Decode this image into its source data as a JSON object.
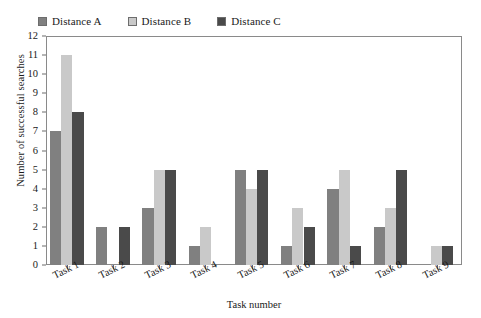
{
  "chart_data": {
    "type": "bar",
    "title": "",
    "xlabel": "Task number",
    "ylabel": "Number of successful searches",
    "categories": [
      "Task 1",
      "Task 2",
      "Task 3",
      "Task 4",
      "Task 5",
      "Task 6",
      "Task 7",
      "Task 8",
      "Task 9"
    ],
    "series": [
      {
        "name": "Distance A",
        "color": "#808080",
        "values": [
          7,
          2,
          3,
          1,
          5,
          1,
          4,
          2,
          0
        ]
      },
      {
        "name": "Distance B",
        "color": "#c9c9c9",
        "values": [
          11,
          0,
          5,
          2,
          4,
          3,
          5,
          3,
          1
        ]
      },
      {
        "name": "Distance C",
        "color": "#4a4a4a",
        "values": [
          8,
          2,
          5,
          0,
          5,
          2,
          1,
          5,
          1
        ]
      }
    ],
    "ylim": [
      0,
      12
    ],
    "yticks": [
      0,
      1,
      2,
      3,
      4,
      5,
      6,
      7,
      8,
      9,
      10,
      11,
      12
    ],
    "ytick_labels": [
      "0",
      "1",
      "2",
      "3",
      "4",
      "5",
      "6",
      "7",
      "8",
      "9",
      "10",
      "11",
      "12"
    ],
    "grid": false,
    "legend_position": "top-left",
    "frame": true
  },
  "legend": {
    "items": [
      {
        "label": "Distance A",
        "color": "#808080"
      },
      {
        "label": "Distance B",
        "color": "#c9c9c9"
      },
      {
        "label": "Distance C",
        "color": "#4a4a4a"
      }
    ]
  },
  "axes": {
    "y_title": "Number of successful searches",
    "x_title": "Task number"
  }
}
